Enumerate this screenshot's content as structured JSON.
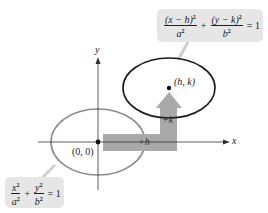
{
  "diagram": {
    "axes": {
      "x_label": "x",
      "y_label": "y"
    },
    "origin": {
      "label": "(0, 0)"
    },
    "center": {
      "label": "(h, k)"
    },
    "shift": {
      "horizontal_label": "+h",
      "vertical_label": "+k"
    },
    "ellipse_original": {
      "equation": {
        "term1_num": "x",
        "term1_den": "a",
        "term2_num": "y",
        "term2_den": "b",
        "exp": "2",
        "plus": "+",
        "equals": "= 1"
      },
      "stroke_color": "#8a8a8a"
    },
    "ellipse_translated": {
      "equation": {
        "term1_num": "(x − h)",
        "term1_den": "a",
        "term2_num": "(y − k)",
        "term2_den": "b",
        "exp": "2",
        "plus": "+",
        "equals": "= 1"
      },
      "stroke_color": "#1a1a1a"
    },
    "colors": {
      "callout_bg": "#e6e6e6",
      "arrow_fill": "#a9a9a9",
      "axis": "#333333"
    }
  }
}
